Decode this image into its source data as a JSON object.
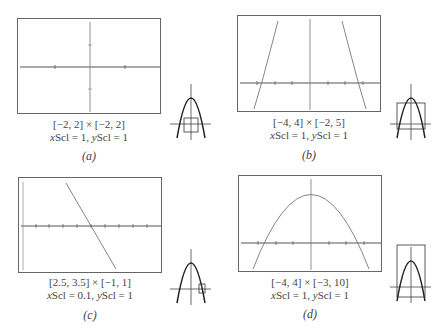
{
  "figure": {
    "function_hint": "parabola opening downward, vertex (0,9), roots at x = ±3",
    "panels": [
      {
        "id": "a",
        "label": "(a)",
        "window": "[−2, 2] × [−2, 2]",
        "scale_prefix_x": "x",
        "scale_text_x": "Scl = 1, ",
        "scale_prefix_y": "y",
        "scale_text_y": "Scl = 1",
        "xmin": -2,
        "xmax": 2,
        "ymin": -2,
        "ymax": 2,
        "xscl": 1,
        "yscl": 1,
        "curve_visible": false
      },
      {
        "id": "b",
        "label": "(b)",
        "window": "[−4, 4] × [−2, 5]",
        "scale_prefix_x": "x",
        "scale_text_x": "Scl = 1, ",
        "scale_prefix_y": "y",
        "scale_text_y": "Scl = 1",
        "xmin": -4,
        "xmax": 4,
        "ymin": -2,
        "ymax": 5,
        "xscl": 1,
        "yscl": 1,
        "curve_visible": true
      },
      {
        "id": "c",
        "label": "(c)",
        "window": "[2.5, 3.5] × [−1, 1]",
        "scale_prefix_x": "x",
        "scale_text_x": "Scl = 0.1, ",
        "scale_prefix_y": "y",
        "scale_text_y": "Scl = 1",
        "xmin": 2.5,
        "xmax": 3.5,
        "ymin": -1,
        "ymax": 1,
        "xscl": 0.1,
        "yscl": 1,
        "curve_visible": true
      },
      {
        "id": "d",
        "label": "(d)",
        "window": "[−4, 4] × [−3, 10]",
        "scale_prefix_x": "x",
        "scale_text_x": "Scl = 1, ",
        "scale_prefix_y": "y",
        "scale_text_y": "Scl = 1",
        "xmin": -4,
        "xmax": 4,
        "ymin": -3,
        "ymax": 10,
        "xscl": 1,
        "yscl": 1,
        "curve_visible": true
      }
    ],
    "colors": {
      "frame": "#666666",
      "axis": "#555555",
      "curve": "#777777",
      "thumb_curve": "#222222",
      "text": "#444444"
    }
  }
}
